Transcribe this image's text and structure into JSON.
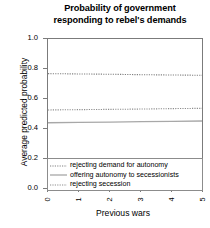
{
  "chart_data": {
    "type": "line",
    "title": "Probability of government responding to rebel's demands",
    "title_lines": [
      "Probability of government",
      "responding to rebel's demands"
    ],
    "xlabel": "Previous wars",
    "ylabel": "Average predicted probability",
    "x": [
      0,
      1,
      2,
      3,
      4,
      5
    ],
    "xlim": [
      0,
      5
    ],
    "ylim": [
      0.0,
      1.0
    ],
    "xticks": [
      "0",
      "1",
      "2",
      "3",
      "4",
      "5"
    ],
    "yticks": [
      "0.0",
      "0.2",
      "0.4",
      "0.6",
      "0.8",
      "1.0"
    ],
    "ytick_values": [
      0.0,
      0.2,
      0.4,
      0.6,
      0.8,
      1.0
    ],
    "grid": false,
    "legend_position": "lower center (inside axes, below data)",
    "series": [
      {
        "name": "rejecting demand for autonomy",
        "style": "dotted",
        "color": "#808080",
        "values": [
          0.769,
          0.767,
          0.765,
          0.762,
          0.76,
          0.758
        ]
      },
      {
        "name": "offering autonomy to secessionists",
        "style": "solid",
        "color": "#a8a8a8",
        "values": [
          0.442,
          0.444,
          0.446,
          0.449,
          0.451,
          0.453
        ]
      },
      {
        "name": "rejecting secession",
        "style": "dotted",
        "color": "#8d8d8d",
        "values": [
          0.527,
          0.529,
          0.531,
          0.533,
          0.536,
          0.538
        ]
      }
    ]
  },
  "legend": {
    "items": [
      {
        "label": "rejecting demand for autonomy"
      },
      {
        "label": "offering autonomy to secessionists"
      },
      {
        "label": "rejecting secession"
      }
    ]
  },
  "colors": {
    "axis": "#7b7b7b",
    "text": "#000000",
    "background": "#ffffff",
    "series_dotted_upper": "#808080",
    "series_solid": "#a8a8a8",
    "series_dotted_lower": "#8d8d8d"
  }
}
